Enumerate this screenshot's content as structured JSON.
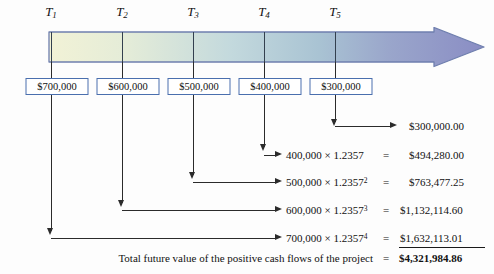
{
  "diagram": {
    "periods": [
      {
        "label": "T",
        "sub": "1",
        "x": 51
      },
      {
        "label": "T",
        "sub": "2",
        "x": 122
      },
      {
        "label": "T",
        "sub": "3",
        "x": 193
      },
      {
        "label": "T",
        "sub": "4",
        "x": 264
      },
      {
        "label": "T",
        "sub": "5",
        "x": 335
      }
    ],
    "cash_flows": [
      {
        "amount": "$700,000",
        "x": 57
      },
      {
        "amount": "$600,000",
        "x": 128
      },
      {
        "amount": "$500,000",
        "x": 199
      },
      {
        "amount": "$400,000",
        "x": 270
      },
      {
        "amount": "$300,000",
        "x": 341
      }
    ],
    "rows": [
      {
        "formula": "",
        "exponent": "",
        "equals": "",
        "result": "$300,000.00",
        "bold": false,
        "from_x": 335,
        "arrow_y": 126,
        "arrow_to_x": 399
      },
      {
        "formula": "400,000 × 1.2357",
        "exponent": "",
        "equals": "=",
        "result": "$494,280.00",
        "bold": false,
        "from_x": 264,
        "arrow_y": 156,
        "arrow_to_x": 284
      },
      {
        "formula": "500,000 × 1.2357",
        "exponent": "2",
        "equals": "=",
        "result": "$763,477.25",
        "bold": false,
        "from_x": 193,
        "arrow_y": 183,
        "arrow_to_x": 284
      },
      {
        "formula": "600,000 × 1.2357",
        "exponent": "3",
        "equals": "=",
        "result": "$1,132,114.60",
        "bold": false,
        "from_x": 122,
        "arrow_y": 211,
        "arrow_to_x": 284
      },
      {
        "formula": "700,000 × 1.2357",
        "exponent": "4",
        "equals": "=",
        "result": "$1,632,113.01",
        "bold": false,
        "from_x": 51,
        "arrow_y": 239,
        "arrow_to_x": 284
      }
    ],
    "total": {
      "label": "Total future value of the positive cash flows of the project",
      "equals": "=",
      "value": "$4,321,984.86"
    },
    "colors": {
      "box_border": "#4a6fae",
      "arrow_bar_start": "#f0f0d2",
      "arrow_bar_mid": "#b8cfd8",
      "arrow_bar_end": "#8a8dc4",
      "line": "#2b2b2b"
    }
  }
}
